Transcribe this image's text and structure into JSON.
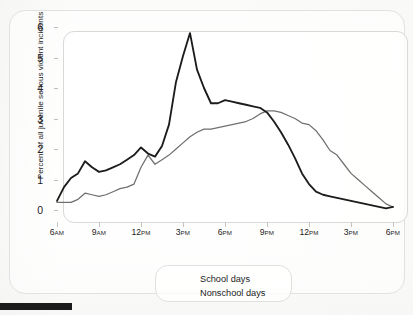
{
  "figure": {
    "legend_box_label": "legend",
    "series_colors": {
      "school": "#1c1c1c",
      "nonschool": "#6f6f6f"
    }
  },
  "chart_data": {
    "type": "line",
    "title": "",
    "subtitle": "",
    "xlabel": "",
    "ylabel": "Percent of all juvenile serious violent incidents",
    "xlim": [
      6,
      30
    ],
    "ylim": [
      0,
      6
    ],
    "grid": false,
    "legend_position": "bottom-center",
    "legend": [
      "School days",
      "Nonschool days"
    ],
    "y_ticks": [
      0,
      1,
      2,
      3,
      4,
      5,
      6
    ],
    "y_tick_labels": [
      "0",
      "1",
      "2",
      "3",
      "4",
      "5",
      "6"
    ],
    "x_ticks": [
      6,
      9,
      12,
      15,
      18,
      21,
      24,
      27,
      30
    ],
    "x_tick_labels": [
      {
        "hour": "6",
        "meridiem": "AM"
      },
      {
        "hour": "9",
        "meridiem": "AM"
      },
      {
        "hour": "12",
        "meridiem": "PM"
      },
      {
        "hour": "3",
        "meridiem": "PM"
      },
      {
        "hour": "6",
        "meridiem": "PM"
      },
      {
        "hour": "9",
        "meridiem": "PM"
      },
      {
        "hour": "12",
        "meridiem": "PM"
      },
      {
        "hour": "3",
        "meridiem": "PM"
      },
      {
        "hour": "6",
        "meridiem": "PM"
      }
    ],
    "x": [
      6,
      6.5,
      7,
      7.5,
      8,
      8.5,
      9,
      9.5,
      10,
      10.5,
      11,
      11.5,
      12,
      12.5,
      13,
      13.5,
      14,
      14.5,
      15,
      15.5,
      16,
      16.5,
      17,
      17.5,
      18,
      18.5,
      19,
      19.5,
      20,
      20.5,
      21,
      21.5,
      22,
      22.5,
      23,
      23.5,
      24,
      24.5,
      25,
      25.5,
      26,
      26.5,
      27,
      27.5,
      28,
      28.5,
      29,
      29.5,
      30
    ],
    "series": [
      {
        "name": "School days",
        "values": [
          0.3,
          0.75,
          1.05,
          1.2,
          1.6,
          1.4,
          1.25,
          1.3,
          1.4,
          1.5,
          1.65,
          1.8,
          2.05,
          1.85,
          1.75,
          2.1,
          2.8,
          4.2,
          5.05,
          5.8,
          4.6,
          4.0,
          3.5,
          3.5,
          3.6,
          3.55,
          3.5,
          3.45,
          3.4,
          3.35,
          3.2,
          2.9,
          2.55,
          2.15,
          1.7,
          1.2,
          0.85,
          0.6,
          0.5,
          0.45,
          0.4,
          0.35,
          0.3,
          0.25,
          0.2,
          0.15,
          0.1,
          0.05,
          0.1
        ]
      },
      {
        "name": "Nonschool days",
        "values": [
          0.25,
          0.25,
          0.25,
          0.35,
          0.55,
          0.5,
          0.45,
          0.5,
          0.6,
          0.7,
          0.75,
          0.85,
          1.4,
          1.8,
          1.5,
          1.65,
          1.8,
          2.0,
          2.2,
          2.4,
          2.55,
          2.65,
          2.65,
          2.7,
          2.75,
          2.8,
          2.85,
          2.9,
          3.0,
          3.15,
          3.25,
          3.25,
          3.2,
          3.1,
          3.0,
          2.85,
          2.8,
          2.6,
          2.3,
          1.95,
          1.8,
          1.5,
          1.2,
          1.0,
          0.8,
          0.6,
          0.4,
          0.2,
          0.1
        ]
      }
    ]
  }
}
